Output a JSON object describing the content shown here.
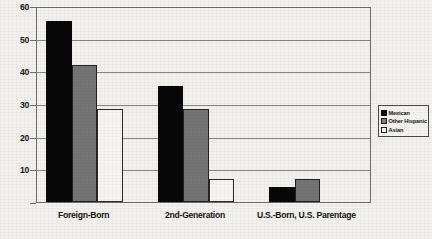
{
  "chart_data": {
    "type": "bar",
    "title": "",
    "subtitle": "",
    "xlabel": "",
    "ylabel": "",
    "ylim": [
      0,
      60
    ],
    "ytick_values": [
      0,
      10,
      20,
      30,
      40,
      50,
      60
    ],
    "ytick_labels": [
      "0",
      "10",
      "20",
      "30",
      "40",
      "50",
      "60"
    ],
    "grid": true,
    "grid_axis": "y",
    "legend_position": "right",
    "categories": [
      "Foreign-Born",
      "2nd-Generation",
      "U.S.-Born, U.S. Parentage"
    ],
    "series": [
      {
        "name": "Mexican",
        "color": "#080808",
        "values": [
          55.5,
          35.5,
          4.5
        ]
      },
      {
        "name": "Other Hispanic",
        "color": "#757575",
        "values": [
          42.0,
          28.5,
          7.0
        ]
      },
      {
        "name": "Asian",
        "color": "#f6f5f2",
        "values": [
          28.5,
          7.0,
          0.0
        ]
      }
    ]
  },
  "legend": {
    "items": [
      {
        "label": "Mexican"
      },
      {
        "label": "Other Hispanic"
      },
      {
        "label": "Asian"
      }
    ]
  },
  "axis": {
    "y_labels": [
      "60",
      "50",
      "40",
      "30",
      "20",
      "10",
      "0"
    ]
  },
  "categories_labels": [
    "Foreign-Born",
    "2nd-Generation",
    "U.S.-Born, U.S. Parentage"
  ]
}
